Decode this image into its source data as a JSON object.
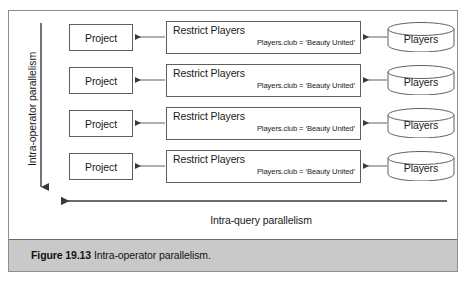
{
  "figure": {
    "caption_label": "Figure 19.13",
    "caption_text": "Intra-operator parallelism.",
    "vertical_axis_label": "Intra-operator parallelism",
    "horizontal_axis_label": "Intra-query parallelism",
    "colors": {
      "frame_border": "#8e8e8e",
      "node_border": "#5f5f5f",
      "arrow": "#3a3a3a",
      "caption_band": "#c9c9c9",
      "text": "#1a1a1a",
      "background": "#ffffff"
    }
  },
  "pipelines": [
    {
      "project": "Project",
      "restrict_title": "Restrict Players",
      "restrict_condition": "Players.club = ‘Beauty United’",
      "source": "Players"
    },
    {
      "project": "Project",
      "restrict_title": "Restrict Players",
      "restrict_condition": "Players.club = ‘Beauty United’",
      "source": "Players"
    },
    {
      "project": "Project",
      "restrict_title": "Restrict Players",
      "restrict_condition": "Players.club = ‘Beauty United’",
      "source": "Players"
    },
    {
      "project": "Project",
      "restrict_title": "Restrict Players",
      "restrict_condition": "Players.club = ‘Beauty United’",
      "source": "Players"
    }
  ]
}
